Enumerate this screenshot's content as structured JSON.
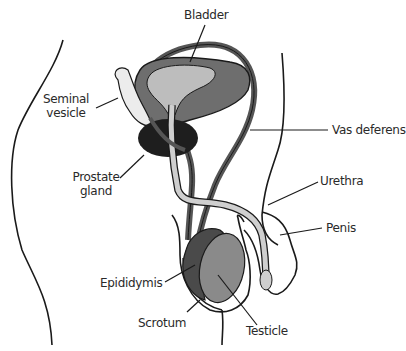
{
  "diagram": {
    "colors": {
      "outline": "#1a1a1a",
      "bladder_wall": "#6e6e6e",
      "bladder_interior": "#bdbdbd",
      "vas_deferens": "#555555",
      "urethra": "#cfcfcf",
      "prostate": "#1e1e1e",
      "seminal_vesicle": "#ececec",
      "epididymis": "#4a4a4a",
      "testicle": "#8a8a8a"
    },
    "labels": {
      "bladder": "Bladder",
      "seminal_vesicle_1": "Seminal",
      "seminal_vesicle_2": "vesicle",
      "vas_deferens": "Vas deferens",
      "prostate_1": "Prostate",
      "prostate_2": "gland",
      "urethra": "Urethra",
      "penis": "Penis",
      "epididymis": "Epididymis",
      "scrotum": "Scrotum",
      "testicle": "Testicle"
    }
  }
}
